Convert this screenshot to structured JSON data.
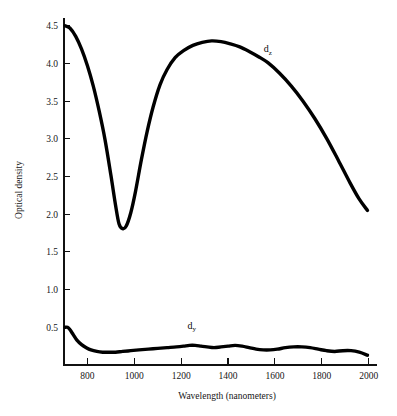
{
  "chart_data": {
    "type": "line",
    "title": "",
    "xlabel": "Wavelength (nanometers)",
    "ylabel": "Optical density",
    "xlim": [
      700,
      2010
    ],
    "ylim": [
      0.0,
      4.55
    ],
    "grid": false,
    "legend_position": "inline-annotation",
    "xticks": [
      800,
      1000,
      1200,
      1400,
      1600,
      1800,
      2000
    ],
    "xtick_labels": [
      "800",
      "1000",
      "1200",
      "1400",
      "1600",
      "1800",
      "2000"
    ],
    "yticks": [
      0.5,
      1.0,
      1.5,
      2.0,
      2.5,
      3.0,
      3.5,
      4.0,
      4.5
    ],
    "ytick_labels": [
      "0.5",
      "1.0",
      "1.5",
      "2.0",
      "2.5",
      "3.0",
      "3.5",
      "4.0",
      "4.5"
    ],
    "series": [
      {
        "name": "d_z",
        "label_text": "d",
        "label_sub": "z",
        "label_x": 1570,
        "label_y": 4.15,
        "color": "#000000",
        "line_width": 3.4,
        "x": [
          705,
          725,
          750,
          775,
          800,
          825,
          850,
          875,
          900,
          920,
          935,
          950,
          965,
          985,
          1005,
          1030,
          1055,
          1080,
          1110,
          1140,
          1175,
          1210,
          1250,
          1290,
          1330,
          1370,
          1410,
          1450,
          1490,
          1530,
          1570,
          1620,
          1670,
          1720,
          1770,
          1820,
          1870,
          1920,
          1960,
          1995
        ],
        "y": [
          4.5,
          4.47,
          4.36,
          4.19,
          3.97,
          3.7,
          3.37,
          2.99,
          2.52,
          2.12,
          1.87,
          1.81,
          1.84,
          2.02,
          2.3,
          2.72,
          3.1,
          3.42,
          3.72,
          3.92,
          4.08,
          4.17,
          4.24,
          4.28,
          4.3,
          4.29,
          4.26,
          4.22,
          4.16,
          4.09,
          4.01,
          3.87,
          3.7,
          3.5,
          3.27,
          3.01,
          2.72,
          2.42,
          2.2,
          2.05
        ]
      },
      {
        "name": "d_y",
        "label_text": "d",
        "label_sub": "y",
        "label_x": 1245,
        "label_y": 0.48,
        "color": "#000000",
        "line_width": 3.4,
        "x": [
          705,
          715,
          725,
          740,
          755,
          775,
          795,
          815,
          840,
          865,
          890,
          920,
          950,
          985,
          1020,
          1060,
          1100,
          1140,
          1180,
          1210,
          1235,
          1260,
          1285,
          1310,
          1340,
          1370,
          1400,
          1430,
          1460,
          1490,
          1520,
          1550,
          1580,
          1610,
          1645,
          1680,
          1715,
          1750,
          1785,
          1820,
          1855,
          1890,
          1925,
          1960,
          1995
        ],
        "y": [
          0.5,
          0.5,
          0.47,
          0.4,
          0.33,
          0.27,
          0.23,
          0.2,
          0.18,
          0.17,
          0.17,
          0.17,
          0.18,
          0.19,
          0.2,
          0.21,
          0.22,
          0.23,
          0.24,
          0.25,
          0.26,
          0.26,
          0.25,
          0.24,
          0.23,
          0.24,
          0.25,
          0.26,
          0.25,
          0.23,
          0.21,
          0.2,
          0.2,
          0.21,
          0.23,
          0.24,
          0.24,
          0.23,
          0.21,
          0.19,
          0.18,
          0.19,
          0.19,
          0.17,
          0.13
        ]
      }
    ]
  },
  "figure": {
    "background_color": "#ffffff",
    "axis_color": "#111111"
  }
}
